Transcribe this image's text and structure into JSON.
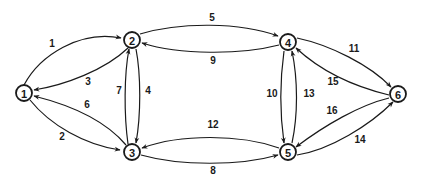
{
  "diagram": {
    "type": "directed-graph",
    "nodes": [
      {
        "id": "1",
        "label": "1",
        "x": 24,
        "y": 93
      },
      {
        "id": "2",
        "label": "2",
        "x": 132,
        "y": 40
      },
      {
        "id": "3",
        "label": "3",
        "x": 132,
        "y": 152
      },
      {
        "id": "4",
        "label": "4",
        "x": 288,
        "y": 42
      },
      {
        "id": "5",
        "label": "5",
        "x": 288,
        "y": 152
      },
      {
        "id": "6",
        "label": "6",
        "x": 398,
        "y": 94
      }
    ],
    "edges": [
      {
        "label": "1",
        "from": "1",
        "to": "2",
        "label_x": 52,
        "label_y": 43
      },
      {
        "label": "2",
        "from": "1",
        "to": "3",
        "label_x": 62,
        "label_y": 136
      },
      {
        "label": "3",
        "from": "2",
        "to": "1",
        "label_x": 88,
        "label_y": 81
      },
      {
        "label": "4",
        "from": "2",
        "to": "3",
        "label_x": 148,
        "label_y": 90
      },
      {
        "label": "5",
        "from": "2",
        "to": "4",
        "label_x": 212,
        "label_y": 17
      },
      {
        "label": "6",
        "from": "3",
        "to": "1",
        "label_x": 87,
        "label_y": 104
      },
      {
        "label": "7",
        "from": "3",
        "to": "2",
        "label_x": 119,
        "label_y": 90
      },
      {
        "label": "8",
        "from": "3",
        "to": "5",
        "label_x": 213,
        "label_y": 170
      },
      {
        "label": "9",
        "from": "4",
        "to": "2",
        "label_x": 213,
        "label_y": 60
      },
      {
        "label": "10",
        "from": "4",
        "to": "5",
        "label_x": 272,
        "label_y": 93
      },
      {
        "label": "11",
        "from": "4",
        "to": "6",
        "label_x": 354,
        "label_y": 48
      },
      {
        "label": "12",
        "from": "5",
        "to": "3",
        "label_x": 213,
        "label_y": 124
      },
      {
        "label": "13",
        "from": "5",
        "to": "4",
        "label_x": 309,
        "label_y": 93
      },
      {
        "label": "14",
        "from": "5",
        "to": "6",
        "label_x": 360,
        "label_y": 139
      },
      {
        "label": "15",
        "from": "6",
        "to": "4",
        "label_x": 333,
        "label_y": 81
      },
      {
        "label": "16",
        "from": "6",
        "to": "5",
        "label_x": 332,
        "label_y": 110
      }
    ]
  }
}
